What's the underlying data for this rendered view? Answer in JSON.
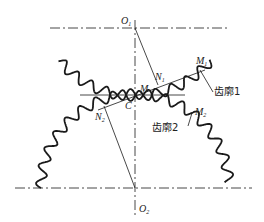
{
  "diagram": {
    "title": "",
    "points": {
      "O1": {
        "main": "O",
        "sub": "1"
      },
      "O2": {
        "main": "O",
        "sub": "2"
      },
      "C": {
        "main": "C",
        "sub": ""
      },
      "M": {
        "main": "M",
        "sub": ""
      },
      "N1": {
        "main": "N",
        "sub": "1"
      },
      "N2": {
        "main": "N",
        "sub": "2"
      },
      "M1": {
        "main": "M",
        "sub": "1"
      },
      "M2": {
        "main": "M",
        "sub": "2"
      }
    },
    "labels": {
      "profile1": "齿廓1",
      "profile2": "齿廓2"
    },
    "colors": {
      "line": "#1a1a1a",
      "background": "#ffffff"
    }
  }
}
